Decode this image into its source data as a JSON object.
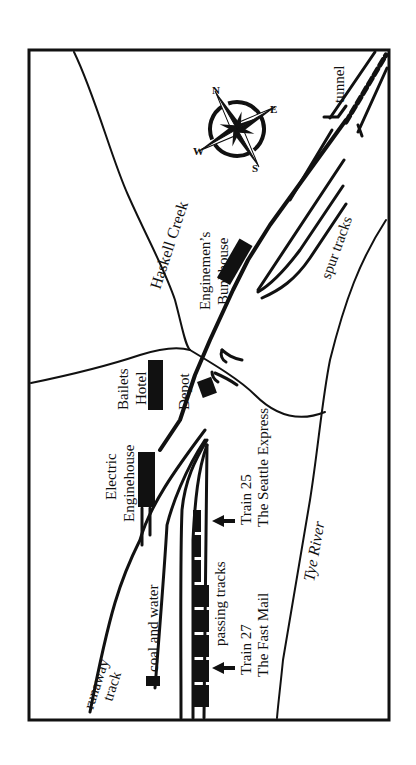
{
  "map": {
    "orientation": "rotated 90 degrees counter-clockwise",
    "colors": {
      "ink": "#111111",
      "paper": "#ffffff"
    },
    "compass": {
      "labels": {
        "n": "N",
        "e": "E",
        "s": "S",
        "w": "W"
      }
    },
    "labels": {
      "haskell_creek": "Haskell Creek",
      "tunnel": "tunnel",
      "bunkhouse_1": "Enginemen’s",
      "bunkhouse_2": "Bunkhouse",
      "spur_tracks": "spur tracks",
      "hotel_1": "Bailets",
      "hotel_2": "Hotel",
      "depot": "Depot",
      "enginehouse_1": "Electric",
      "enginehouse_2": "Enginehouse",
      "train25_1": "Train 25",
      "train25_2": "The Seattle Express",
      "coal_water": "coal and water",
      "passing_tracks": "passing tracks",
      "train27_1": "Train 27",
      "train27_2": "The Fast Mail",
      "tye_river": "Tye River",
      "runaway_1": "runaway",
      "runaway_2": "track"
    }
  }
}
